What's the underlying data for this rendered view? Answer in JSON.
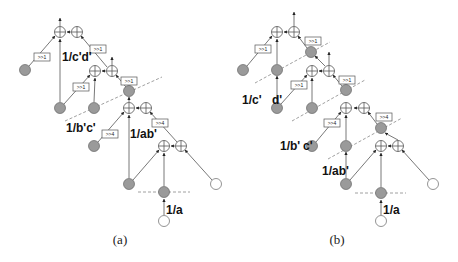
{
  "figure": {
    "panels": [
      {
        "caption": "(a)",
        "labels": [
          "1/c'd'",
          "1/b'c'",
          "1/ab'",
          "1/a"
        ],
        "shift_boxes": [
          ">>1",
          ">>1",
          ">>1",
          ">>1",
          ">>4",
          ">>4"
        ]
      },
      {
        "caption": "(b)",
        "labels": [
          "1/c'",
          "d'",
          "1/b'",
          "c'",
          "1/ab'",
          "1/a"
        ],
        "shift_boxes": [
          ">>1",
          ">>1",
          ">>1",
          ">>1",
          ">>4",
          ">>4"
        ]
      }
    ],
    "legend_semantics": {
      "sum_node": "adder-icon",
      "gray_node": "multiplier/storage node",
      "white_node": "input node",
      "dashed_line": "pipeline cut"
    }
  }
}
